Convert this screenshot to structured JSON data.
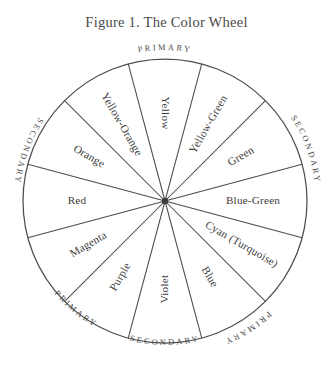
{
  "figure": {
    "title": "Figure 1. The Color Wheel",
    "center_x": 165,
    "center_y": 201,
    "radius": 142,
    "stroke_color": "#4c4c4c",
    "text_color": "#3d3d3d",
    "background": "#ffffff"
  },
  "wheel": {
    "segment_count": 12,
    "segments": [
      {
        "label": "Yellow",
        "category": "primary",
        "center_angle_deg": 0
      },
      {
        "label": "Yellow-Green",
        "category": "secondary",
        "center_angle_deg": 30
      },
      {
        "label": "Green",
        "category": "secondary",
        "center_angle_deg": 60
      },
      {
        "label": "Blue-Green",
        "category": "secondary",
        "center_angle_deg": 90
      },
      {
        "label": "Cyan (Turquoise)",
        "category": "primary",
        "center_angle_deg": 120
      },
      {
        "label": "Blue",
        "category": "primary",
        "center_angle_deg": 150
      },
      {
        "label": "Violet",
        "category": "secondary",
        "center_angle_deg": 180
      },
      {
        "label": "Purple",
        "category": "secondary",
        "center_angle_deg": 210
      },
      {
        "label": "Magenta",
        "category": "secondary",
        "center_angle_deg": 240
      },
      {
        "label": "Red",
        "category": "primary",
        "center_angle_deg": 270
      },
      {
        "label": "Orange",
        "category": "secondary",
        "center_angle_deg": 300
      },
      {
        "label": "Yellow-Orange",
        "category": "secondary",
        "center_angle_deg": 330
      }
    ]
  },
  "ring_labels": {
    "top": "PRIMARY",
    "upper_right": "SECONDARY",
    "lower_right": "PRIMARY",
    "bottom": "SECONDARY",
    "lower_left": "PRIMARY",
    "upper_left": "SECONDARY"
  }
}
